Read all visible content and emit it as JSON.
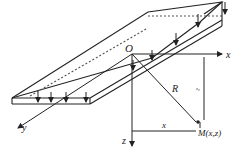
{
  "diagram": {
    "labels": {
      "origin": "O",
      "x_axis": "x",
      "y_axis": "y",
      "z_axis": "z",
      "radius": "R",
      "x_dim": "x",
      "z_dim": "z₀",
      "point": "M(x,z)"
    },
    "colors": {
      "line": "#222222",
      "dashed": "#555555",
      "background": "#ffffff"
    }
  }
}
